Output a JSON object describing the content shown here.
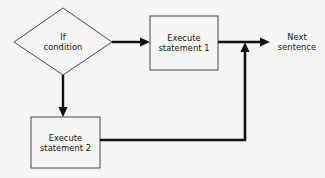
{
  "diagram": {
    "type": "flowchart",
    "background_color": "#f6f5f3",
    "node_stroke_color": "#4a4a4a",
    "connector_color": "#101010",
    "text_color": "#121212",
    "nodes": [
      {
        "id": "if-condition",
        "shape": "diamond",
        "label": "If\ncondition",
        "line1": "If",
        "line2": "condition"
      },
      {
        "id": "execute-statement-1",
        "shape": "rectangle",
        "label": "Execute\nstatement 1",
        "line1": "Execute",
        "line2": "statement 1"
      },
      {
        "id": "execute-statement-2",
        "shape": "rectangle",
        "label": "Execute\nstatement 2",
        "line1": "Execute",
        "line2": "statement 2"
      }
    ],
    "annotations": [
      {
        "id": "next-sentence",
        "label": "Next\nsentence",
        "line1": "Next",
        "line2": "sentence"
      }
    ],
    "connectors": [
      {
        "id": "condition-to-statement-1",
        "from": "if-condition",
        "to": "execute-statement-1",
        "direction": "right",
        "arrowhead": true
      },
      {
        "id": "condition-to-statement-2",
        "from": "if-condition",
        "to": "execute-statement-2",
        "direction": "down",
        "arrowhead": true
      },
      {
        "id": "statement-1-to-next",
        "from": "execute-statement-1",
        "to": "next-sentence",
        "direction": "right",
        "arrowhead": true
      },
      {
        "id": "statement-2-to-merge",
        "from": "execute-statement-2",
        "to": "statement-1-to-next",
        "direction": "right-then-up",
        "arrowhead": true
      }
    ]
  }
}
